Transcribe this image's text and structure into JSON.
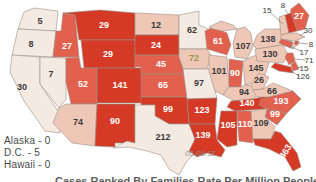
{
  "chart_data": {
    "type": "heatmap",
    "subtype": "us-state-choropleth",
    "date_label": "05.09.11",
    "caption_partial": "Cases Ranked By Families Rate Per Million People",
    "notes": [
      "Alaska - 0",
      "D.C. - 5",
      "Hawaii - 0"
    ],
    "legend_position": "none",
    "states": [
      {
        "abbr": "WA",
        "name": "Washington",
        "value": 5,
        "level": "pale"
      },
      {
        "abbr": "OR",
        "name": "Oregon",
        "value": 8,
        "level": "pale"
      },
      {
        "abbr": "CA",
        "name": "California",
        "value": 30,
        "level": "pale"
      },
      {
        "abbr": "NV",
        "name": "Nevada",
        "value": 7,
        "level": "pale"
      },
      {
        "abbr": "ID",
        "name": "Idaho",
        "value": 27,
        "level": "medium"
      },
      {
        "abbr": "MT",
        "name": "Montana",
        "value": 29,
        "level": "dark"
      },
      {
        "abbr": "WY",
        "name": "Wyoming",
        "value": 29,
        "level": "dark"
      },
      {
        "abbr": "UT",
        "name": "Utah",
        "value": 52,
        "level": "medium"
      },
      {
        "abbr": "CO",
        "name": "Colorado",
        "value": 141,
        "level": "dark"
      },
      {
        "abbr": "AZ",
        "name": "Arizona",
        "value": 74,
        "level": "light"
      },
      {
        "abbr": "NM",
        "name": "New Mexico",
        "value": 90,
        "level": "dark"
      },
      {
        "abbr": "ND",
        "name": "North Dakota",
        "value": 12,
        "level": "light"
      },
      {
        "abbr": "SD",
        "name": "South Dakota",
        "value": 24,
        "level": "dark"
      },
      {
        "abbr": "NE",
        "name": "Nebraska",
        "value": 45,
        "level": "medium"
      },
      {
        "abbr": "KS",
        "name": "Kansas",
        "value": 65,
        "level": "medium"
      },
      {
        "abbr": "OK",
        "name": "Oklahoma",
        "value": 99,
        "level": "dark"
      },
      {
        "abbr": "TX",
        "name": "Texas",
        "value": 212,
        "level": "pale"
      },
      {
        "abbr": "MN",
        "name": "Minnesota",
        "value": 62,
        "level": "pale"
      },
      {
        "abbr": "IA",
        "name": "Iowa",
        "value": 72,
        "level": "light",
        "text_color": "#97994d"
      },
      {
        "abbr": "MO",
        "name": "Missouri",
        "value": 97,
        "level": "pale"
      },
      {
        "abbr": "AR",
        "name": "Arkansas",
        "value": 123,
        "level": "dark"
      },
      {
        "abbr": "LA",
        "name": "Louisiana",
        "value": 139,
        "level": "dark"
      },
      {
        "abbr": "WI",
        "name": "Wisconsin",
        "value": 61,
        "level": "medium"
      },
      {
        "abbr": "IL",
        "name": "Illinois",
        "value": 101,
        "level": "light"
      },
      {
        "abbr": "MI",
        "name": "Michigan",
        "value": 107,
        "level": "light"
      },
      {
        "abbr": "IN",
        "name": "Indiana",
        "value": 90,
        "level": "medium"
      },
      {
        "abbr": "OH",
        "name": "Ohio",
        "value": 145,
        "level": "light"
      },
      {
        "abbr": "KY",
        "name": "Kentucky",
        "value": 94,
        "level": "light"
      },
      {
        "abbr": "TN",
        "name": "Tennessee",
        "value": 140,
        "level": "dark"
      },
      {
        "abbr": "WV",
        "name": "West Virginia",
        "value": 26,
        "level": "light"
      },
      {
        "abbr": "VA",
        "name": "Virginia",
        "value": 66,
        "level": "light"
      },
      {
        "abbr": "NC",
        "name": "North Carolina",
        "value": 193,
        "level": "medium"
      },
      {
        "abbr": "SC",
        "name": "South Carolina",
        "value": 99,
        "level": "medium"
      },
      {
        "abbr": "GA",
        "name": "Georgia",
        "value": 109,
        "level": "light"
      },
      {
        "abbr": "AL",
        "name": "Alabama",
        "value": 110,
        "level": "medium"
      },
      {
        "abbr": "MS",
        "name": "Mississippi",
        "value": 105,
        "level": "dark"
      },
      {
        "abbr": "FL",
        "name": "Florida",
        "value": 463,
        "level": "dark"
      },
      {
        "abbr": "NY",
        "name": "New York",
        "value": 138,
        "level": "light"
      },
      {
        "abbr": "PA",
        "name": "Pennsylvania",
        "value": 130,
        "level": "light"
      },
      {
        "abbr": "ME",
        "name": "Maine",
        "value": 27,
        "level": "medium"
      },
      {
        "abbr": "VT",
        "name": "Vermont",
        "value": 15,
        "level": "light",
        "callout": true
      },
      {
        "abbr": "NH",
        "name": "New Hampshire",
        "value": 8,
        "level": "dark",
        "callout": true
      },
      {
        "abbr": "MA",
        "name": "Massachusetts",
        "value": 30,
        "level": "light",
        "callout": true
      },
      {
        "abbr": "RI",
        "name": "Rhode Island",
        "value": 8,
        "level": "medium",
        "callout": true
      },
      {
        "abbr": "CT",
        "name": "Connecticut",
        "value": 17,
        "level": "medium",
        "callout": true
      },
      {
        "abbr": "NJ",
        "name": "New Jersey",
        "value": 71,
        "level": "medium",
        "callout": true
      },
      {
        "abbr": "DE",
        "name": "Delaware",
        "value": 15,
        "level": "medium",
        "callout": true
      },
      {
        "abbr": "MD",
        "name": "Maryland",
        "value": 126,
        "level": "dark",
        "callout": true
      }
    ],
    "non_contiguous": [
      {
        "name": "Alaska",
        "value": 0
      },
      {
        "name": "D.C.",
        "value": 5
      },
      {
        "name": "Hawaii",
        "value": 0
      }
    ]
  },
  "colors": {
    "dark": "#d53a26",
    "medium": "#e2604e",
    "light": "#efc7b7",
    "pale": "#f4eae2",
    "border": "#9b9088",
    "label_on_dark": "#ffffff",
    "label_on_light": "#3b3b3b",
    "callout_label": "#3a3a3a",
    "note_text": "#474747",
    "date_text": "#8f8f8f",
    "caption_text": "#5f5f5f"
  }
}
